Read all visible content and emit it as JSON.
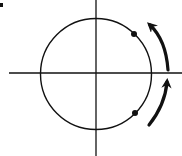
{
  "diagram": {
    "type": "circle-on-axes",
    "colors": {
      "background": "#ffffff",
      "stroke": "#111111"
    },
    "axes": {
      "origin": [
        96,
        73
      ],
      "horizontal": {
        "x1": 9,
        "x2": 182,
        "y": 73
      },
      "vertical": {
        "x": 96,
        "y1": 0,
        "y2": 156
      }
    },
    "circle": {
      "cx": 96,
      "cy": 74,
      "r": 55.5
    },
    "points": [
      {
        "name": "upper-point",
        "x": 134,
        "y": 34
      },
      {
        "name": "lower-point",
        "x": 135,
        "y": 113
      }
    ],
    "arrows": [
      {
        "name": "upper-arrow",
        "direction": "counterclockwise",
        "tail": [
          168,
          70
        ],
        "tip": [
          147,
          20
        ]
      },
      {
        "name": "lower-arrow",
        "direction": "counterclockwise",
        "tail": [
          149,
          126
        ],
        "tip": [
          168,
          75
        ]
      }
    ]
  }
}
